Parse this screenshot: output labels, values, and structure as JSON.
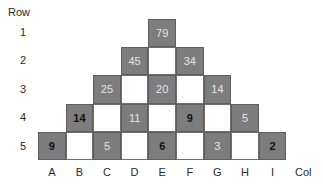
{
  "axes": {
    "row_title": "Row",
    "col_title": "Col",
    "row_labels": [
      "1",
      "2",
      "3",
      "4",
      "5"
    ],
    "col_labels": [
      "A",
      "B",
      "C",
      "D",
      "E",
      "F",
      "G",
      "H",
      "I"
    ]
  },
  "colors": {
    "shaded_cell": "#7d7d7d",
    "blank_cell": "#ffffff",
    "light_text": "#e6e6e6",
    "bold_text": "#111111"
  },
  "cells": [
    {
      "row": 1,
      "col": "E",
      "value": "79",
      "shaded": true,
      "bold": false
    },
    {
      "row": 2,
      "col": "D",
      "value": "45",
      "shaded": true,
      "bold": false
    },
    {
      "row": 2,
      "col": "E",
      "value": "",
      "shaded": false,
      "bold": false
    },
    {
      "row": 2,
      "col": "F",
      "value": "34",
      "shaded": true,
      "bold": false
    },
    {
      "row": 3,
      "col": "C",
      "value": "25",
      "shaded": true,
      "bold": false
    },
    {
      "row": 3,
      "col": "D",
      "value": "",
      "shaded": false,
      "bold": false
    },
    {
      "row": 3,
      "col": "E",
      "value": "20",
      "shaded": true,
      "bold": false
    },
    {
      "row": 3,
      "col": "F",
      "value": "",
      "shaded": false,
      "bold": false
    },
    {
      "row": 3,
      "col": "G",
      "value": "14",
      "shaded": true,
      "bold": false
    },
    {
      "row": 4,
      "col": "B",
      "value": "14",
      "shaded": true,
      "bold": true
    },
    {
      "row": 4,
      "col": "C",
      "value": "",
      "shaded": false,
      "bold": false
    },
    {
      "row": 4,
      "col": "D",
      "value": "11",
      "shaded": true,
      "bold": false
    },
    {
      "row": 4,
      "col": "E",
      "value": "",
      "shaded": false,
      "bold": false
    },
    {
      "row": 4,
      "col": "F",
      "value": "9",
      "shaded": true,
      "bold": true
    },
    {
      "row": 4,
      "col": "G",
      "value": "",
      "shaded": false,
      "bold": false
    },
    {
      "row": 4,
      "col": "H",
      "value": "5",
      "shaded": true,
      "bold": false
    },
    {
      "row": 5,
      "col": "A",
      "value": "9",
      "shaded": true,
      "bold": true
    },
    {
      "row": 5,
      "col": "B",
      "value": "",
      "shaded": false,
      "bold": false
    },
    {
      "row": 5,
      "col": "C",
      "value": "5",
      "shaded": true,
      "bold": false
    },
    {
      "row": 5,
      "col": "D",
      "value": "",
      "shaded": false,
      "bold": false
    },
    {
      "row": 5,
      "col": "E",
      "value": "6",
      "shaded": true,
      "bold": true
    },
    {
      "row": 5,
      "col": "F",
      "value": "",
      "shaded": false,
      "bold": false
    },
    {
      "row": 5,
      "col": "G",
      "value": "3",
      "shaded": true,
      "bold": false
    },
    {
      "row": 5,
      "col": "H",
      "value": "",
      "shaded": false,
      "bold": false
    },
    {
      "row": 5,
      "col": "I",
      "value": "2",
      "shaded": true,
      "bold": true
    }
  ]
}
